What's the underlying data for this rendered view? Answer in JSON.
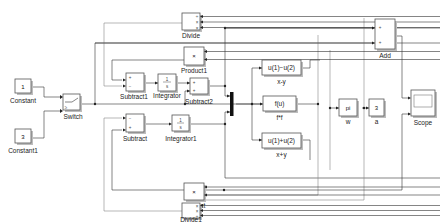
{
  "diagram": {
    "blocks": {
      "constant": {
        "value": "1",
        "label": "Constant"
      },
      "constant1": {
        "value": "3",
        "label": "Constant1"
      },
      "switch": {
        "label": "Switch"
      },
      "divide": {
        "label": "Divide",
        "ports": [
          "÷",
          "×",
          "×"
        ]
      },
      "product1": {
        "label": "Product1",
        "symbol": "×"
      },
      "subtract1": {
        "label": "Subtract1",
        "ports": [
          "+",
          "−"
        ]
      },
      "integrator": {
        "label": "Integrator",
        "num": "1",
        "den": "s"
      },
      "subtract2": {
        "label": "Subtract2",
        "ports": [
          "+",
          "+"
        ]
      },
      "subtract": {
        "label": "Subtract",
        "ports": [
          "−",
          "+"
        ]
      },
      "integrator1": {
        "label": "Integrator1",
        "num": "1",
        "den": "s"
      },
      "product": {
        "label": "Product",
        "symbol": "×"
      },
      "divide1": {
        "label": "Divide1",
        "ports": [
          "×",
          "×",
          "÷"
        ]
      },
      "fcn_xy": {
        "expr": "u(1)−u(2)",
        "label": "x-y"
      },
      "fcn_f": {
        "expr": "f(u)",
        "label": "f*f"
      },
      "fcn_xpy": {
        "expr": "u(1)+u(2)",
        "label": "x+y"
      },
      "w": {
        "value": "pi",
        "label": "w"
      },
      "a": {
        "value": "3",
        "label": "a"
      },
      "add": {
        "label": "Add",
        "ports": [
          "+",
          "+"
        ]
      },
      "scope": {
        "label": "Scope"
      }
    }
  }
}
